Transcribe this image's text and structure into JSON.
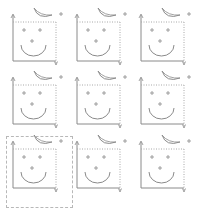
{
  "grid": {
    "rows": 3,
    "cols": 3,
    "tile_name": "smiley-chart-icon",
    "selected_index": 6,
    "tiles": [
      {
        "id": "tile-1",
        "x": 0,
        "y": 0
      },
      {
        "id": "tile-2",
        "x": 64,
        "y": 0
      },
      {
        "id": "tile-3",
        "x": 128,
        "y": 0
      },
      {
        "id": "tile-4",
        "x": 0,
        "y": 63
      },
      {
        "id": "tile-5",
        "x": 64,
        "y": 63
      },
      {
        "id": "tile-6",
        "x": 128,
        "y": 63
      },
      {
        "id": "tile-7",
        "x": 0,
        "y": 127
      },
      {
        "id": "tile-8",
        "x": 64,
        "y": 127
      },
      {
        "id": "tile-9",
        "x": 128,
        "y": 127
      }
    ]
  },
  "colors": {
    "stroke": "#8a8a8a",
    "dotted": "#b0b0b0",
    "selection": "#b8b8b8",
    "background": "#ffffff"
  }
}
